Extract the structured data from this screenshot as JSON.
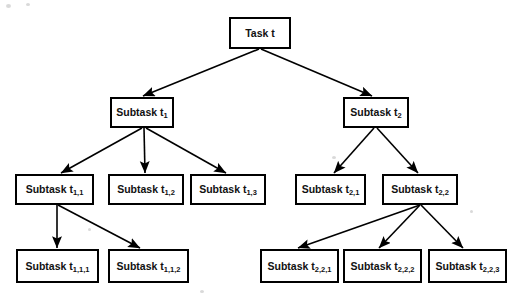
{
  "diagram": {
    "type": "tree",
    "background_color": "#ffffff",
    "node_fill": "#ffffff",
    "node_stroke": "#000000",
    "edge_color": "#000000",
    "nodes": [
      {
        "id": "root",
        "label": "Task t",
        "base": "Task t",
        "sub": "",
        "x": 230,
        "y": 18,
        "w": 60,
        "h": 30,
        "level": 0
      },
      {
        "id": "t1",
        "label": "Subtask t1",
        "base": "Subtask t",
        "sub": "1",
        "x": 111,
        "y": 98,
        "w": 62,
        "h": 29,
        "level": 1
      },
      {
        "id": "t2",
        "label": "Subtask t2",
        "base": "Subtask t",
        "sub": "2",
        "x": 344,
        "y": 98,
        "w": 64,
        "h": 29,
        "level": 1
      },
      {
        "id": "t11",
        "label": "Subtask t1,1",
        "base": "Subtask t",
        "sub": "1,1",
        "x": 16,
        "y": 175,
        "w": 77,
        "h": 29,
        "level": 2
      },
      {
        "id": "t12",
        "label": "Subtask t1,2",
        "base": "Subtask t",
        "sub": "1,2",
        "x": 109,
        "y": 175,
        "w": 74,
        "h": 29,
        "level": 2
      },
      {
        "id": "t13",
        "label": "Subtask t1,3",
        "base": "Subtask t",
        "sub": "1,3",
        "x": 191,
        "y": 175,
        "w": 74,
        "h": 29,
        "level": 2
      },
      {
        "id": "t21",
        "label": "Subtask t2,1",
        "base": "Subtask t",
        "sub": "2,1",
        "x": 296,
        "y": 175,
        "w": 69,
        "h": 29,
        "level": 2
      },
      {
        "id": "t22",
        "label": "Subtask t2,2",
        "base": "Subtask t",
        "sub": "2,2",
        "x": 383,
        "y": 175,
        "w": 74,
        "h": 29,
        "level": 2
      },
      {
        "id": "t111",
        "label": "Subtask t1,1,1",
        "base": "Subtask t",
        "sub": "1,1,1",
        "x": 17,
        "y": 250,
        "w": 81,
        "h": 32,
        "level": 3
      },
      {
        "id": "t112",
        "label": "Subtask t1,1,2",
        "base": "Subtask t",
        "sub": "1,1,2",
        "x": 109,
        "y": 250,
        "w": 79,
        "h": 32,
        "level": 3
      },
      {
        "id": "t221",
        "label": "Subtask t2,2,1",
        "base": "Subtask t",
        "sub": "2,2,1",
        "x": 261,
        "y": 250,
        "w": 77,
        "h": 32,
        "level": 3
      },
      {
        "id": "t222",
        "label": "Subtask t2,2,2",
        "base": "Subtask t",
        "sub": "2,2,2",
        "x": 344,
        "y": 250,
        "w": 77,
        "h": 32,
        "level": 3
      },
      {
        "id": "t223",
        "label": "Subtask t2,2,3",
        "base": "Subtask t",
        "sub": "2,2,3",
        "x": 429,
        "y": 250,
        "w": 77,
        "h": 32,
        "level": 3
      }
    ],
    "edges": [
      {
        "from": "root",
        "to": "t1",
        "x1": 259,
        "y1": 49,
        "x2": 143,
        "y2": 96
      },
      {
        "from": "root",
        "to": "t2",
        "x1": 261,
        "y1": 49,
        "x2": 372,
        "y2": 96
      },
      {
        "from": "t1",
        "to": "t11",
        "x1": 142,
        "y1": 128,
        "x2": 61,
        "y2": 173
      },
      {
        "from": "t1",
        "to": "t12",
        "x1": 144,
        "y1": 128,
        "x2": 145,
        "y2": 173
      },
      {
        "from": "t1",
        "to": "t13",
        "x1": 146,
        "y1": 128,
        "x2": 226,
        "y2": 173
      },
      {
        "from": "t2",
        "to": "t21",
        "x1": 374,
        "y1": 128,
        "x2": 334,
        "y2": 173
      },
      {
        "from": "t2",
        "to": "t22",
        "x1": 377,
        "y1": 128,
        "x2": 418,
        "y2": 173
      },
      {
        "from": "t11",
        "to": "t111",
        "x1": 57,
        "y1": 205,
        "x2": 57,
        "y2": 248
      },
      {
        "from": "t11",
        "to": "t112",
        "x1": 58,
        "y1": 205,
        "x2": 140,
        "y2": 248
      },
      {
        "from": "t22",
        "to": "t221",
        "x1": 420,
        "y1": 205,
        "x2": 298,
        "y2": 248
      },
      {
        "from": "t22",
        "to": "t222",
        "x1": 420,
        "y1": 205,
        "x2": 379,
        "y2": 248
      },
      {
        "from": "t22",
        "to": "t223",
        "x1": 421,
        "y1": 205,
        "x2": 463,
        "y2": 248
      }
    ]
  }
}
